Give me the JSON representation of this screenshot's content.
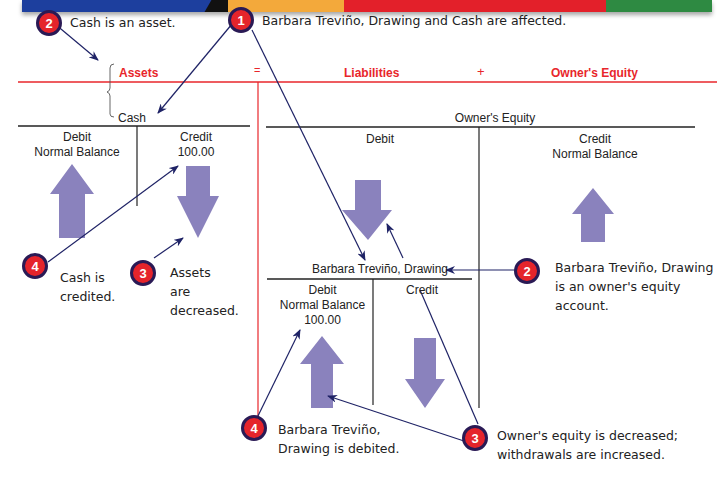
{
  "banner": {
    "colors": [
      "#1d3f9e",
      "#111111",
      "#f3a93b",
      "#e3202a",
      "#2e8a42"
    ]
  },
  "equation": {
    "assets": "Assets",
    "equals": "=",
    "liabilities": "Liabilities",
    "plus": "+",
    "owners_equity": "Owner's Equity",
    "line_color": "#e8262b"
  },
  "callouts": {
    "step1": {
      "number": "1",
      "text": "Barbara Treviño, Drawing and Cash are affected."
    },
    "step2_cash": {
      "number": "2",
      "text": "Cash is an asset."
    },
    "step2_drawing": {
      "number": "2",
      "lines": [
        "Barbara Treviño, Drawing",
        "is an owner's equity",
        "account."
      ]
    },
    "step3_cash": {
      "number": "3",
      "lines": [
        "Assets",
        "are",
        "decreased."
      ]
    },
    "step3_equity": {
      "number": "3",
      "lines": [
        "Owner's equity is decreased;",
        "withdrawals are increased."
      ]
    },
    "step4_cash": {
      "number": "4",
      "lines": [
        "Cash is",
        "credited."
      ]
    },
    "step4_drawing": {
      "number": "4",
      "lines": [
        "Barbara Treviño,",
        "Drawing is debited."
      ]
    }
  },
  "t_accounts": {
    "cash": {
      "title": "Cash",
      "debit_label": "Debit",
      "debit_sub": "Normal Balance",
      "credit_label": "Credit",
      "credit_amount": "100.00"
    },
    "owners_equity": {
      "title": "Owner's Equity",
      "debit_label": "Debit",
      "credit_label": "Credit",
      "credit_sub": "Normal Balance"
    },
    "drawing": {
      "title": "Barbara Treviño, Drawing",
      "debit_label": "Debit",
      "debit_sub": "Normal Balance",
      "debit_amount": "100.00",
      "credit_label": "Credit"
    }
  },
  "colors": {
    "arrow_fill": "#8a82bd",
    "pointer_line": "#1f2366",
    "badge_fill": "#e5242b"
  }
}
